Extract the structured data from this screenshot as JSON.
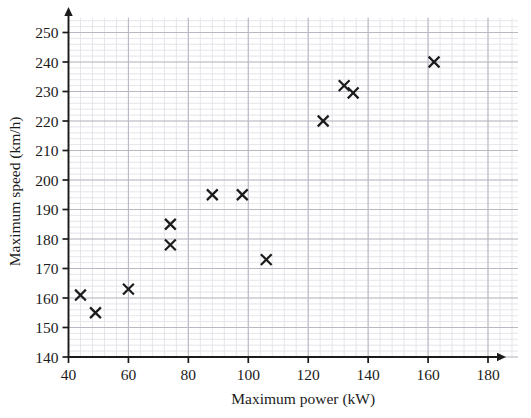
{
  "chart_data": {
    "type": "scatter",
    "title": "",
    "xlabel": "Maximum power (kW)",
    "ylabel": "Maximum speed (km/h)",
    "xlim": [
      40,
      190
    ],
    "ylim": [
      140,
      255
    ],
    "xticks": [
      40,
      60,
      80,
      100,
      120,
      140,
      160,
      180
    ],
    "yticks": [
      140,
      150,
      160,
      170,
      180,
      190,
      200,
      210,
      220,
      230,
      240,
      250
    ],
    "xtick_labels": [
      "40",
      "60",
      "80",
      "100",
      "120",
      "140",
      "160",
      "180"
    ],
    "ytick_labels": [
      "140",
      "150",
      "160",
      "170",
      "180",
      "190",
      "200",
      "210",
      "220",
      "230",
      "240",
      "250"
    ],
    "x_major_step": 20,
    "y_major_step": 10,
    "x_minor_per_major": 5,
    "y_minor_per_major": 5,
    "grid": true,
    "grid_style": "graph-paper",
    "legend": "none",
    "marker": "x",
    "marker_color": "#1b1b1b",
    "points": [
      {
        "x": 44,
        "y": 161
      },
      {
        "x": 49,
        "y": 155
      },
      {
        "x": 60,
        "y": 163
      },
      {
        "x": 74,
        "y": 185
      },
      {
        "x": 74,
        "y": 178
      },
      {
        "x": 88,
        "y": 195
      },
      {
        "x": 98,
        "y": 195
      },
      {
        "x": 106,
        "y": 173
      },
      {
        "x": 125,
        "y": 220
      },
      {
        "x": 132,
        "y": 232
      },
      {
        "x": 135,
        "y": 229.5
      },
      {
        "x": 162,
        "y": 240
      }
    ]
  },
  "colors": {
    "major_grid": "#b9b9c4",
    "minor_grid": "#dedee6",
    "axis": "#1b1b1b",
    "marker": "#1b1b1b",
    "background": "#ffffff"
  }
}
